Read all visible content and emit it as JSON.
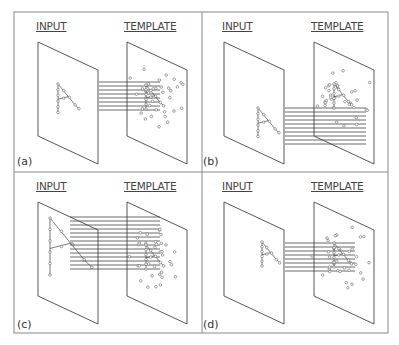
{
  "figure": {
    "panels": [
      {
        "id": "a",
        "tag": "(a)",
        "input_label": "INPUT",
        "template_label": "TEMPLATE"
      },
      {
        "id": "b",
        "tag": "(b)",
        "input_label": "INPUT",
        "template_label": "TEMPLATE"
      },
      {
        "id": "c",
        "tag": "(c)",
        "input_label": "INPUT",
        "template_label": "TEMPLATE"
      },
      {
        "id": "d",
        "tag": "(d)",
        "input_label": "INPUT",
        "template_label": "TEMPLATE"
      }
    ],
    "colors": {
      "line": "#444444",
      "border": "#888888",
      "point": "#666666"
    }
  }
}
